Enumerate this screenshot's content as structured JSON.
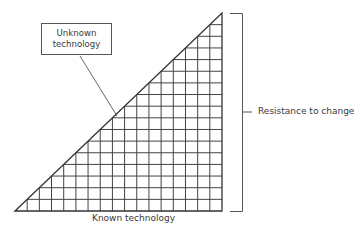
{
  "diagram": {
    "type": "triangle-grid",
    "callout_label": {
      "line1": "Unknown",
      "line2": "technology"
    },
    "base_label": "Known technology",
    "bracket_label": "Resistance to change",
    "grid": {
      "columns": 17,
      "rows": 17
    },
    "colors": {
      "line": "#333333",
      "grid": "#444444",
      "text": "#3a3a3a",
      "background": "#ffffff"
    }
  }
}
